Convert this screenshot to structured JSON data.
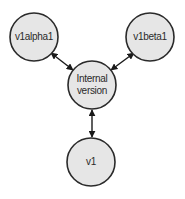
{
  "diagram": {
    "nodes": [
      {
        "id": "v1alpha1",
        "label": "v1alpha1"
      },
      {
        "id": "v1beta1",
        "label": "v1beta1"
      },
      {
        "id": "internal",
        "label_lines": [
          "Internal",
          "version"
        ]
      },
      {
        "id": "v1",
        "label": "v1"
      }
    ],
    "edges": [
      {
        "from": "v1alpha1",
        "to": "internal",
        "direction": "bidirectional"
      },
      {
        "from": "v1beta1",
        "to": "internal",
        "direction": "bidirectional"
      },
      {
        "from": "v1",
        "to": "internal",
        "direction": "bidirectional"
      }
    ],
    "colors": {
      "node_fill": "#e6e6e6",
      "stroke": "#2a2a2a"
    }
  }
}
